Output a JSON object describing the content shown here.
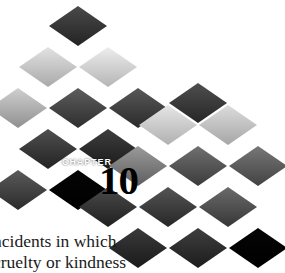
{
  "page": {
    "background_color": "#ffffff",
    "width": 285,
    "height": 273
  },
  "chapter_header": {
    "label": "CHAPTER",
    "number": "10",
    "label_color": "#ffffff",
    "number_color": "#000000"
  },
  "body_copy": {
    "lines": [
      "ncidents in which",
      "cruelty or kindness"
    ]
  },
  "artwork": {
    "name": "isometric-diamond-tile-mosaic",
    "tile_width": 58,
    "tile_height": 40,
    "palette": {
      "black": "#050505",
      "near_black": "#1d1d1d",
      "dark": "#3a3a3a",
      "dark_mid": "#555555",
      "mid": "#6f6f6f",
      "mid_light": "#8d8d8d",
      "light": "#a8a8a8",
      "lighter": "#c2c2c2",
      "pale": "#d8d8d8",
      "palest": "#e8e8e8"
    },
    "tiles": [
      {
        "name": "tile-r0-c1",
        "x": 78,
        "y": 26,
        "top": "#4a4a4a",
        "bottom": "#232323"
      },
      {
        "name": "tile-r1-c0",
        "x": 48,
        "y": 67,
        "top": "#e2e2e2",
        "bottom": "#a9a9a9"
      },
      {
        "name": "tile-r1-c1",
        "x": 108,
        "y": 67,
        "top": "#ededed",
        "bottom": "#b5b5b5"
      },
      {
        "name": "tile-r2-c0",
        "x": 18,
        "y": 108,
        "top": "#cfcfcf",
        "bottom": "#909090"
      },
      {
        "name": "tile-r2-c1",
        "x": 78,
        "y": 108,
        "top": "#5d5d5d",
        "bottom": "#2e2e2e"
      },
      {
        "name": "tile-r2-c2",
        "x": 138,
        "y": 108,
        "top": "#585858",
        "bottom": "#2a2a2a"
      },
      {
        "name": "tile-r2-c3",
        "x": 198,
        "y": 103,
        "top": "#4e4e4e",
        "bottom": "#262626"
      },
      {
        "name": "tile-r3-c0",
        "x": 48,
        "y": 149,
        "top": "#4f4f4f",
        "bottom": "#232323"
      },
      {
        "name": "tile-r3-c1",
        "x": 108,
        "y": 149,
        "top": "#3d3d3d",
        "bottom": "#1b1b1b"
      },
      {
        "name": "tile-r3-c2",
        "x": 168,
        "y": 125,
        "top": "#e6e6e6",
        "bottom": "#b0b0b0"
      },
      {
        "name": "tile-r3-c3",
        "x": 228,
        "y": 125,
        "top": "#dcdcdc",
        "bottom": "#a6a6a6"
      },
      {
        "name": "tile-r4-c0",
        "x": 18,
        "y": 190,
        "top": "#5a5a5a",
        "bottom": "#2b2b2b"
      },
      {
        "name": "tile-r4-c1",
        "x": 78,
        "y": 190,
        "top": "#050505",
        "bottom": "#000000"
      },
      {
        "name": "tile-r4-c2",
        "x": 138,
        "y": 166,
        "top": "#9a9a9a",
        "bottom": "#5e5e5e"
      },
      {
        "name": "tile-r4-c3",
        "x": 198,
        "y": 166,
        "top": "#707070",
        "bottom": "#3b3b3b"
      },
      {
        "name": "tile-r4-c4",
        "x": 258,
        "y": 166,
        "top": "#777777",
        "bottom": "#424242"
      },
      {
        "name": "tile-r5-c1",
        "x": 108,
        "y": 207,
        "top": "#4a4a4a",
        "bottom": "#202020"
      },
      {
        "name": "tile-r5-c2",
        "x": 168,
        "y": 207,
        "top": "#545454",
        "bottom": "#272727"
      },
      {
        "name": "tile-r5-c3",
        "x": 228,
        "y": 207,
        "top": "#6a6a6a",
        "bottom": "#373737"
      },
      {
        "name": "tile-r6-c2",
        "x": 138,
        "y": 248,
        "top": "#3a3a3a",
        "bottom": "#1a1a1a"
      },
      {
        "name": "tile-r6-c3",
        "x": 198,
        "y": 248,
        "top": "#3f3f3f",
        "bottom": "#1c1c1c"
      },
      {
        "name": "tile-r6-c4",
        "x": 258,
        "y": 248,
        "top": "#050505",
        "bottom": "#000000"
      }
    ]
  }
}
